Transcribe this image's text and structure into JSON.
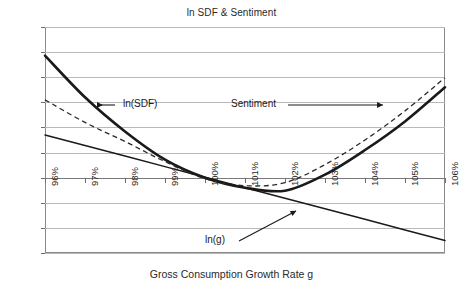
{
  "chart_data": {
    "type": "line",
    "title": "ln SDF & Sentiment",
    "xlabel": "Gross Consumption Growth Rate g",
    "ylabel": "",
    "grid": true,
    "legend_position": "inline-annotations",
    "xlim": [
      96,
      106
    ],
    "ylim": [
      -0.15,
      0.3
    ],
    "x": [
      96,
      97,
      98,
      99,
      100,
      101,
      102,
      103,
      104,
      105,
      106
    ],
    "categories": [
      "96%",
      "97%",
      "98%",
      "99%",
      "100%",
      "101%",
      "102%",
      "103%",
      "104%",
      "105%",
      "106%"
    ],
    "ytick_values": [
      0.3,
      0.25,
      0.2,
      0.15,
      0.1,
      0.05,
      0.0,
      -0.05,
      -0.1,
      -0.15
    ],
    "ytick_labels": [
      "0.3",
      "0.2",
      "0.2",
      "0.1",
      "0.1",
      "0.0",
      "-0.1",
      "-0.1"
    ],
    "ytick_labels_full": [
      "0.3",
      "0.25",
      "0.2",
      "0.15",
      "0.1",
      "0.05",
      "0.0",
      "-0.05",
      "-0.1",
      "-0.15"
    ],
    "series": [
      {
        "name": "ln(SDF)",
        "style": "solid-thick",
        "color": "#1a1a1a",
        "values": [
          0.243,
          0.16,
          0.092,
          0.036,
          0.0,
          -0.02,
          -0.026,
          0.006,
          0.055,
          0.112,
          0.18
        ]
      },
      {
        "name": "Sentiment",
        "style": "dashed",
        "color": "#2b2b2b",
        "values": [
          0.155,
          0.11,
          0.072,
          0.032,
          -0.002,
          -0.016,
          -0.01,
          0.026,
          0.075,
          0.133,
          0.199
        ]
      },
      {
        "name": "ln(g)",
        "style": "solid-thin",
        "color": "#1a1a1a",
        "values": [
          0.085,
          0.064,
          0.043,
          0.022,
          0.001,
          -0.02,
          -0.041,
          -0.062,
          -0.083,
          -0.104,
          -0.125
        ]
      }
    ],
    "annotations": [
      {
        "id": "ln-sdf",
        "text": "ln(SDF)",
        "arrow": "left"
      },
      {
        "id": "sentiment",
        "text": "Sentiment",
        "arrow": "right"
      },
      {
        "id": "ln-g",
        "text": "ln(g)",
        "arrow": "leader"
      }
    ]
  }
}
